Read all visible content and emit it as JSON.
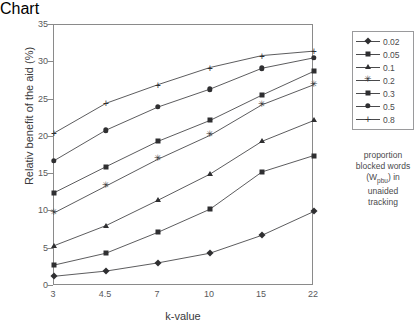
{
  "chart_data": {
    "type": "line",
    "title": "",
    "xlabel": "k-value",
    "ylabel": "Relativ benefit of the aid (%)",
    "categories": [
      "3",
      "4.5",
      "7",
      "10",
      "15",
      "22"
    ],
    "x": [
      3,
      4.5,
      7,
      10,
      15,
      22
    ],
    "xlim": [
      3,
      22
    ],
    "ylim": [
      0,
      35
    ],
    "yticks": [
      0,
      5,
      10,
      15,
      20,
      25,
      30,
      35
    ],
    "ytick_labels": [
      "0",
      "5",
      "10",
      "15",
      "20",
      "25",
      "30",
      "35"
    ],
    "grid": false,
    "legend_position": "right",
    "legend_title_lines": [
      "proportion",
      "blocked words",
      "(W_pbu) in",
      "unaided",
      "tracking"
    ],
    "series": [
      {
        "name": "0.02",
        "marker": "diamond",
        "values": [
          1.3,
          2.0,
          3.1,
          4.4,
          6.8,
          10.0
        ]
      },
      {
        "name": "0.05",
        "marker": "square",
        "values": [
          2.8,
          4.4,
          7.2,
          10.3,
          15.3,
          17.5
        ]
      },
      {
        "name": "0.1",
        "marker": "triangle",
        "values": [
          5.4,
          8.1,
          11.5,
          15.0,
          19.4,
          22.2
        ]
      },
      {
        "name": "0.2",
        "marker": "star",
        "values": [
          9.8,
          13.4,
          17.0,
          20.2,
          24.3,
          27.0
        ]
      },
      {
        "name": "0.3",
        "marker": "square",
        "values": [
          12.5,
          16.0,
          19.4,
          22.2,
          25.6,
          28.8
        ]
      },
      {
        "name": "0.5",
        "marker": "circle",
        "values": [
          16.8,
          20.9,
          24.0,
          26.4,
          29.2,
          30.6
        ]
      },
      {
        "name": "0.8",
        "marker": "plus",
        "values": [
          20.5,
          24.5,
          27.0,
          29.3,
          30.9,
          31.5
        ]
      }
    ]
  },
  "axes": {
    "y_title": "Relativ benefit of the aid (%)",
    "x_title": "k-value"
  },
  "legend": {
    "items": [
      {
        "label": "0.02"
      },
      {
        "label": "0.05"
      },
      {
        "label": "0.1"
      },
      {
        "label": "0.2"
      },
      {
        "label": "0.3"
      },
      {
        "label": "0.5"
      },
      {
        "label": "0.8"
      }
    ],
    "note_line1": "proportion",
    "note_line2": "blocked words",
    "note_prefix": "(W",
    "note_sub": "pbu",
    "note_suffix": ") in",
    "note_line4": "unaided",
    "note_line5": "tracking"
  },
  "colors": {
    "line": "#4a4a4c",
    "marker": "#2f2f31",
    "frame": "#8a8a8a",
    "text": "#3a3a3c",
    "tick_text": "#59595b"
  }
}
